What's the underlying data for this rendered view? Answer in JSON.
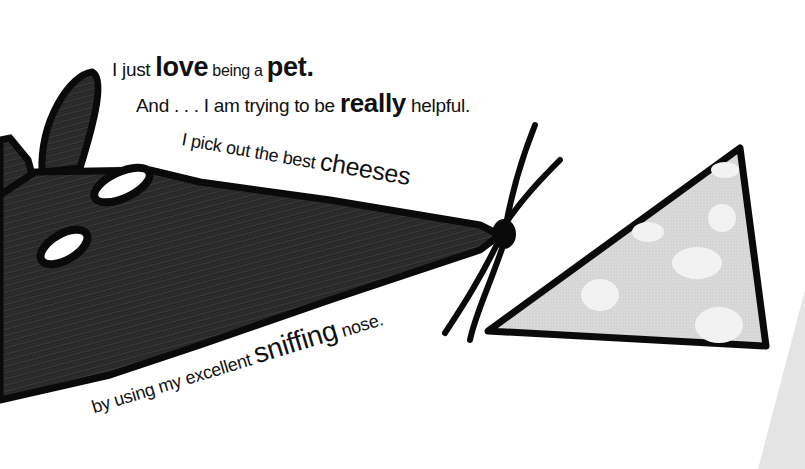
{
  "page": {
    "type": "storybook-illustration",
    "colors": {
      "background": "#ffffff",
      "mouse_fur": "#2a2a2a",
      "outline": "#0a0a0a",
      "cheese": "#d9d9d9",
      "cheese_holes": "#f2f2f2",
      "cheese_partial": "#e6e6e6"
    }
  },
  "text": {
    "line1": {
      "a": "I just ",
      "b": "love",
      "c": " being a ",
      "d": "pet."
    },
    "line2": {
      "a": "And . . .  I am trying to be ",
      "b": "really",
      "c": " helpful."
    },
    "line3": {
      "a": "I pick out the best ",
      "b": "cheeses"
    },
    "line4": {
      "a": "by using my excellent ",
      "b": "sniffing",
      "c": " nose."
    },
    "line5": {
      "a": "(text cut off at bottom edge)"
    }
  },
  "illustration": {
    "mouse": {
      "label": "mouse-head",
      "features": [
        "ears",
        "eyes",
        "nose",
        "whiskers"
      ]
    },
    "cheese": {
      "label": "cheese-wedge",
      "holes": 6
    },
    "partial_cheese": {
      "label": "cheese-wedge-partial"
    }
  }
}
